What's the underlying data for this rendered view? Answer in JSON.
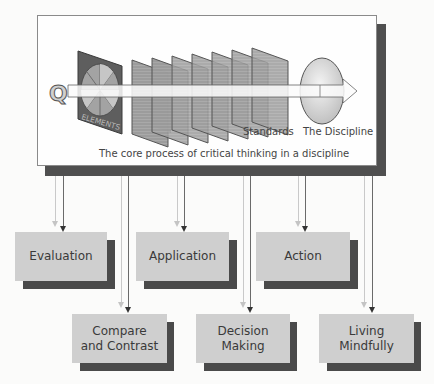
{
  "diagram": {
    "top_label_fragment": "",
    "core": {
      "question_glyph": "Q",
      "elements_label": "ELEMENTS",
      "standards_label": "Standards",
      "discipline_label": "The Discipline",
      "caption": "The core process of critical thinking in a discipline",
      "standards_panel_count": 7
    },
    "outcomes": [
      {
        "id": "evaluation",
        "label": "Evaluation",
        "row": 1
      },
      {
        "id": "application",
        "label": "Application",
        "row": 1
      },
      {
        "id": "action",
        "label": "Action",
        "row": 1
      },
      {
        "id": "compare-contrast",
        "label": "Compare\nand Contrast",
        "row": 2
      },
      {
        "id": "decision-making",
        "label": "Decision\nMaking",
        "row": 2
      },
      {
        "id": "living-mindfully",
        "label": "Living\nMindfully",
        "row": 2
      }
    ],
    "colors": {
      "box_fill": "#cfcfcf",
      "box_shadow": "#4a4a4a",
      "frame_shadow": "#4f4f4f",
      "arrow_dark": "#333333",
      "arrow_pale": "#c4c4c4"
    }
  }
}
